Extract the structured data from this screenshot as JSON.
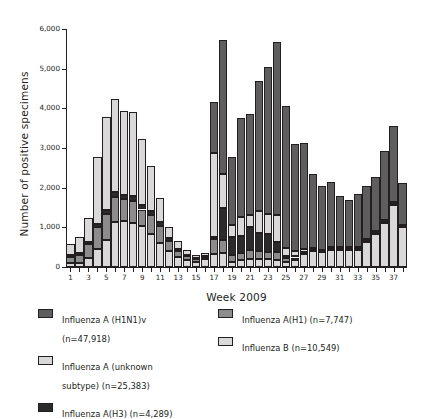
{
  "chart_data": {
    "type": "bar",
    "subtype": "stacked-vertical",
    "title": "",
    "xlabel": "Week 2009",
    "ylabel": "Number of positive specimens",
    "ylim": [
      0,
      6000
    ],
    "ytick_values": [
      0,
      1000,
      2000,
      3000,
      4000,
      5000,
      6000
    ],
    "ytick_labels": [
      "0",
      "1,000",
      "2,000",
      "3,000",
      "4,000",
      "5,000",
      "6,000"
    ],
    "grid": false,
    "legend_position": "below-plot",
    "categories": [
      1,
      2,
      3,
      4,
      5,
      6,
      7,
      8,
      9,
      10,
      11,
      12,
      13,
      14,
      15,
      16,
      17,
      18,
      19,
      20,
      21,
      22,
      23,
      24,
      25,
      26,
      27,
      28,
      29,
      30,
      31,
      32,
      33,
      34,
      35,
      36,
      37,
      38
    ],
    "xtick_labels": [
      "1",
      "3",
      "5",
      "7",
      "9",
      "11",
      "13",
      "15",
      "17",
      "19",
      "21",
      "23",
      "25",
      "27",
      "29",
      "31",
      "33",
      "35",
      "37"
    ],
    "stack_order_bottom_to_top": [
      "Influenza B",
      "Influenza A(H1)",
      "Influenza A(H3)",
      "Influenza A (unknown subtype)",
      "Influenza A (H1N1)v"
    ],
    "series": [
      {
        "name": "Influenza B",
        "key": "b",
        "color": "#d9d9d9",
        "total": 10549,
        "values": [
          100,
          110,
          230,
          460,
          680,
          1140,
          1150,
          1110,
          1030,
          820,
          600,
          400,
          250,
          170,
          130,
          190,
          340,
          350,
          130,
          170,
          210,
          210,
          200,
          180,
          130,
          180,
          330,
          400,
          370,
          430,
          440,
          440,
          440,
          640,
          840,
          1110,
          1570,
          1000
        ]
      },
      {
        "name": "Influenza A(H1)",
        "key": "h1",
        "color": "#8c8c8c",
        "total": 7747,
        "values": [
          160,
          200,
          350,
          540,
          650,
          620,
          560,
          560,
          420,
          480,
          430,
          250,
          150,
          100,
          60,
          60,
          370,
          340,
          170,
          180,
          220,
          190,
          190,
          190,
          90,
          60,
          30,
          20,
          20,
          20,
          20,
          20,
          20,
          20,
          20,
          20,
          20,
          20
        ]
      },
      {
        "name": "Influenza A(H3)",
        "key": "h3",
        "color": "#2b2b2b",
        "total": 4289,
        "values": [
          40,
          50,
          60,
          80,
          100,
          120,
          110,
          120,
          120,
          120,
          110,
          80,
          60,
          40,
          30,
          40,
          50,
          800,
          460,
          440,
          590,
          450,
          440,
          270,
          70,
          40,
          20,
          20,
          20,
          20,
          20,
          20,
          20,
          20,
          20,
          20,
          20,
          20
        ]
      },
      {
        "name": "Influenza A (unknown subtype)",
        "key": "unknown",
        "color": "#d9d9d9",
        "total": 25383,
        "values": [
          280,
          390,
          600,
          1690,
          2340,
          2360,
          2110,
          2110,
          1650,
          1120,
          600,
          290,
          200,
          130,
          90,
          60,
          2120,
          850,
          290,
          460,
          290,
          560,
          510,
          680,
          190,
          120,
          70,
          40,
          30,
          30,
          30,
          30,
          30,
          30,
          30,
          30,
          30,
          30
        ]
      },
      {
        "name": "Influenza A (H1N1)v",
        "key": "h1n1v",
        "color": "#5e5e5e",
        "total": 47918,
        "values": [
          0,
          0,
          0,
          0,
          0,
          0,
          0,
          0,
          0,
          0,
          0,
          0,
          0,
          0,
          0,
          0,
          1270,
          3380,
          1720,
          2500,
          2540,
          3280,
          3700,
          4360,
          3570,
          2690,
          2680,
          1870,
          1610,
          1650,
          1270,
          1190,
          1340,
          1340,
          1350,
          1740,
          1920,
          1060
        ]
      }
    ],
    "totals": [
      580,
      750,
      1240,
      2770,
      3770,
      4240,
      3930,
      3900,
      3220,
      2640,
      1740,
      1020,
      810,
      440,
      310,
      350,
      4150,
      5720,
      2770,
      3750,
      3850,
      4690,
      5040,
      5680,
      4050,
      3090,
      3130,
      2350,
      2050,
      2150,
      1780,
      1700,
      1850,
      2050,
      2260,
      2920,
      3560,
      2130
    ]
  },
  "legend": {
    "left_column": [
      {
        "label": "Influenza A (H1N1)v\n(n=47,918)",
        "swatch_name": "legend-swatch-h1n1v",
        "color": "#5e5e5e"
      },
      {
        "label": "Influenza A (unknown\nsubtype) (n=25,383)",
        "swatch_name": "legend-swatch-unknown",
        "color": "#d9d9d9"
      },
      {
        "label": "Influenza A(H3) (n=4,289)",
        "swatch_name": "legend-swatch-h3",
        "color": "#2b2b2b"
      }
    ],
    "right_column": [
      {
        "label": "Influenza A(H1) (n=7,747)",
        "swatch_name": "legend-swatch-h1",
        "color": "#8c8c8c"
      },
      {
        "label": "Influenza B (n=10,549)",
        "swatch_name": "legend-swatch-b",
        "color": "#d9d9d9"
      }
    ]
  },
  "axis": {
    "y_title": "Number of positive specimens",
    "x_title": "Week 2009"
  }
}
